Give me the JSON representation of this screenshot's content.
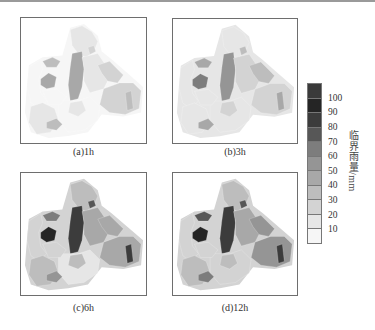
{
  "figure": {
    "panels": [
      {
        "id": "a",
        "caption": "(a)1h",
        "duration": "1h"
      },
      {
        "id": "b",
        "caption": "(b)3h",
        "duration": "3h"
      },
      {
        "id": "c",
        "caption": "(c)6h",
        "duration": "6h"
      },
      {
        "id": "d",
        "caption": "(d)12h",
        "duration": "12h"
      }
    ],
    "colorbar": {
      "label": "临界雨量/mm",
      "ticks": [
        "100",
        "90",
        "80",
        "70",
        "60",
        "50",
        "40",
        "30",
        "20",
        "10"
      ],
      "colors": [
        "#3a3a3a",
        "#252525",
        "#3c3c3c",
        "#575757",
        "#7d7d7d",
        "#959595",
        "#a8a8a8",
        "#bdbdbd",
        "#d3d3d3",
        "#e6e6e6",
        "#f6f6f6"
      ]
    }
  },
  "chart_data": {
    "type": "heatmap",
    "title": "",
    "subplots": [
      "(a)1h",
      "(b)3h",
      "(c)6h",
      "(d)12h"
    ],
    "legend": {
      "label": "临界雨量/mm",
      "ticks": [
        10,
        20,
        30,
        40,
        50,
        60,
        70,
        80,
        90,
        100
      ],
      "position": "right"
    },
    "grid": false,
    "regions": [
      "north",
      "north_small",
      "center_tall",
      "west_dark",
      "west_small",
      "west_big",
      "center_mid",
      "east_upper",
      "east_lower",
      "east_strip",
      "south_west",
      "south_center",
      "south_small",
      "center_low",
      "west_lower"
    ],
    "values_mm": {
      "1h": [
        12,
        25,
        45,
        40,
        30,
        8,
        15,
        20,
        22,
        30,
        10,
        8,
        35,
        12,
        8
      ],
      "3h": [
        18,
        35,
        55,
        65,
        45,
        12,
        25,
        30,
        28,
        45,
        18,
        12,
        45,
        20,
        12
      ],
      "6h": [
        30,
        70,
        80,
        90,
        65,
        20,
        40,
        45,
        45,
        80,
        30,
        15,
        55,
        30,
        20
      ],
      "12h": [
        35,
        75,
        85,
        95,
        70,
        25,
        45,
        50,
        50,
        85,
        35,
        20,
        60,
        35,
        25
      ]
    }
  }
}
